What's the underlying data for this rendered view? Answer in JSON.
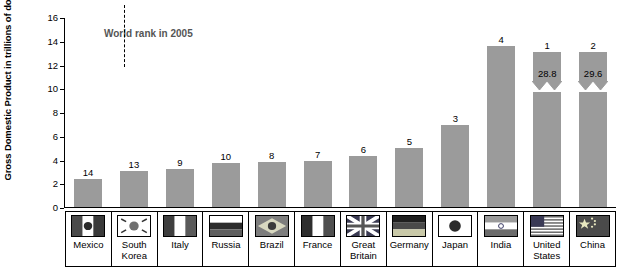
{
  "chart_data": {
    "type": "bar",
    "title": "",
    "annotation": "World rank in 2005",
    "xlabel": "",
    "ylabel": "Gross Domestic Product in trillions of dollars",
    "ylim": [
      0,
      16
    ],
    "yticks": [
      "0",
      "2",
      "4",
      "6",
      "8",
      "10",
      "12",
      "14",
      "16"
    ],
    "grid": false,
    "legend": "none",
    "categories": [
      "Mexico",
      "South\nKorea",
      "Italy",
      "Russia",
      "Brazil",
      "France",
      "Great\nBritain",
      "Germany",
      "Japan",
      "India",
      "United\nStates",
      "China"
    ],
    "values": [
      2.4,
      3.0,
      3.2,
      3.7,
      3.8,
      3.9,
      4.3,
      5.0,
      6.9,
      13.6,
      28.8,
      29.6
    ],
    "display_values": [
      null,
      null,
      null,
      null,
      null,
      null,
      null,
      null,
      null,
      null,
      "28.8",
      "29.6"
    ],
    "axis_break": [
      false,
      false,
      false,
      false,
      false,
      false,
      false,
      false,
      false,
      false,
      true,
      true
    ],
    "ranks": [
      "14",
      "13",
      "9",
      "10",
      "8",
      "7",
      "6",
      "5",
      "3",
      "4",
      "1",
      "2"
    ],
    "bar_color": "#9b9b9b"
  },
  "flags": [
    {
      "name": "mexico-flag"
    },
    {
      "name": "south-korea-flag"
    },
    {
      "name": "italy-flag"
    },
    {
      "name": "russia-flag"
    },
    {
      "name": "brazil-flag"
    },
    {
      "name": "france-flag"
    },
    {
      "name": "great-britain-flag"
    },
    {
      "name": "germany-flag"
    },
    {
      "name": "japan-flag"
    },
    {
      "name": "india-flag"
    },
    {
      "name": "united-states-flag"
    },
    {
      "name": "china-flag"
    }
  ]
}
